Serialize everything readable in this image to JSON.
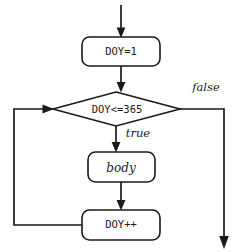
{
  "diagram": {
    "type": "flowchart",
    "stroke_color": "#1a1a1a",
    "fill_color": "#ffffff",
    "background_color": "#ffffff",
    "nodes": [
      {
        "id": "init",
        "shape": "rounded-rectangle",
        "label": "DOY=1",
        "font": "mono",
        "x": 121,
        "y": 51,
        "width": 78,
        "height": 29
      },
      {
        "id": "condition",
        "shape": "diamond",
        "label": "DOY<=365",
        "font": "mono",
        "x": 116,
        "y": 109,
        "width": 127,
        "height": 35
      },
      {
        "id": "body",
        "shape": "rounded-rectangle",
        "label": "body",
        "font": "italic",
        "x": 121,
        "y": 167,
        "width": 67,
        "height": 30
      },
      {
        "id": "increment",
        "shape": "rounded-rectangle",
        "label": "DOY++",
        "font": "mono",
        "x": 121,
        "y": 225,
        "width": 78,
        "height": 30
      }
    ],
    "edges": [
      {
        "id": "entry",
        "from": "start",
        "to": "init",
        "label": ""
      },
      {
        "id": "init-to-cond",
        "from": "init",
        "to": "condition",
        "label": ""
      },
      {
        "id": "cond-true",
        "from": "condition",
        "to": "body",
        "label": "true"
      },
      {
        "id": "cond-false",
        "from": "condition",
        "to": "exit",
        "label": "false"
      },
      {
        "id": "body-to-inc",
        "from": "body",
        "to": "increment",
        "label": ""
      },
      {
        "id": "loop-back",
        "from": "increment",
        "to": "condition",
        "label": ""
      }
    ],
    "labels": {
      "true": "true",
      "false": "false"
    }
  }
}
